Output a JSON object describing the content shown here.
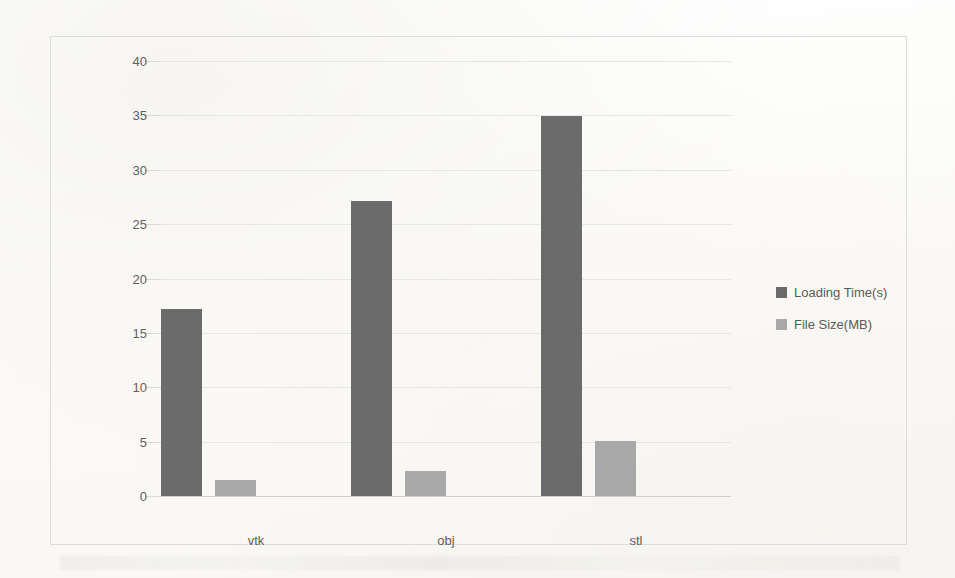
{
  "chart_data": {
    "type": "bar",
    "title": "",
    "subtitle": "",
    "xlabel": "",
    "ylabel": "",
    "categories": [
      "vtk",
      "obj",
      "stl"
    ],
    "series": [
      {
        "name": "Loading Time(s)",
        "values": [
          17.2,
          27.1,
          34.9
        ],
        "color": "#6b6b6b"
      },
      {
        "name": "File Size(MB)",
        "values": [
          1.5,
          2.3,
          5.1
        ],
        "color": "#a8a8a8"
      }
    ],
    "ylim": [
      0,
      40
    ],
    "ytick_labels": [
      "0",
      "5",
      "10",
      "15",
      "20",
      "25",
      "30",
      "35",
      "40"
    ],
    "ytick_values": [
      0,
      5,
      10,
      15,
      20,
      25,
      30,
      35,
      40
    ],
    "grid": true,
    "legend": {
      "position": "right",
      "entries": [
        "Loading Time(s)",
        "File Size(MB)"
      ]
    },
    "colors": {
      "series_0": "#6b6b6b",
      "series_1": "#a8a8a8",
      "gridline": "#e6e6e6",
      "border": "#dddddd",
      "background": "#fdfdfb",
      "tick_text": "#5f5f5f"
    }
  }
}
